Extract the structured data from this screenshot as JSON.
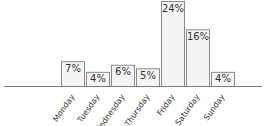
{
  "chart_data": {
    "type": "bar",
    "title": "",
    "xlabel": "",
    "ylabel": "",
    "categories": [
      "Monday",
      "Tuesday",
      "Wednesday",
      "Thursday",
      "Friday",
      "Saturday",
      "Sunday"
    ],
    "values": [
      7,
      4,
      6,
      5,
      24,
      16,
      4
    ],
    "value_unit": "%",
    "data_labels": [
      "7%",
      "4%",
      "6%",
      "5%",
      "24%",
      "16%",
      "4%"
    ],
    "ylim": [
      0,
      24
    ],
    "grid": false,
    "legend": "none",
    "y_axis_visible": false,
    "tick_label_rotation": "diagonal",
    "colors": {
      "bar_fill": "#f4f4f4",
      "bar_stroke": "#8a8a8a",
      "text": "#333333",
      "baseline": "#7a7a7a"
    }
  }
}
